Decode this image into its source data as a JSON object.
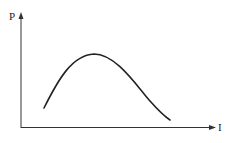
{
  "diagram": {
    "y_axis_label": "P",
    "x_axis_label": "I",
    "curve": "single-peaked curve rising from low value to a maximum then falling"
  },
  "colors": {
    "line": "#222222",
    "background": "#ffffff"
  }
}
